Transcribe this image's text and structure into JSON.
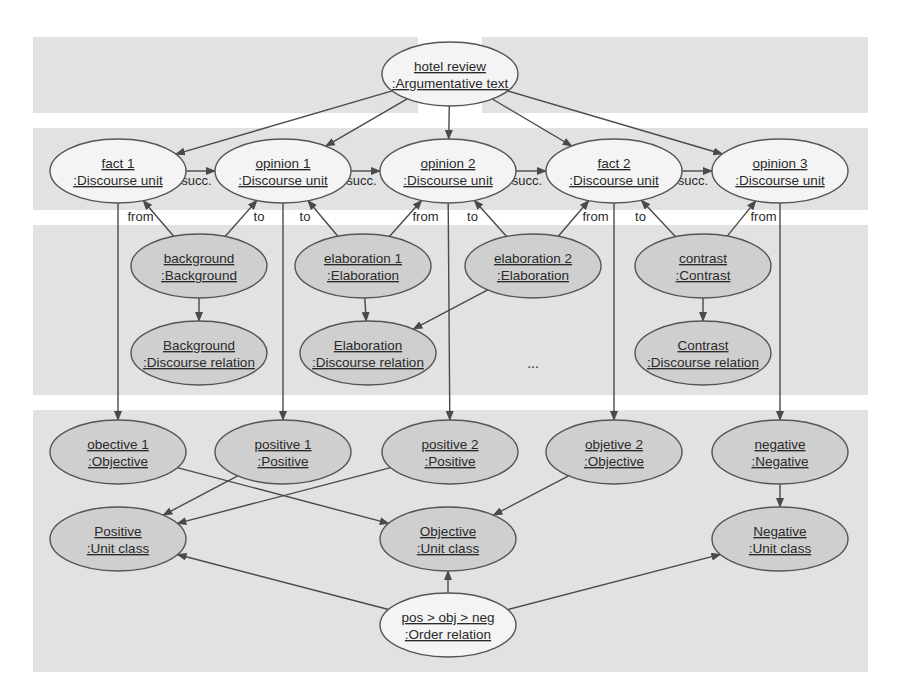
{
  "diagram": {
    "type": "uml-object-diagram",
    "colors": {
      "band": "#e2e2e2",
      "node_white": "#f4f4f4",
      "node_gray": "#cfcfcf",
      "stroke": "#555555",
      "text": "#2a2a2a"
    },
    "nodes": [
      {
        "id": "hotel_review",
        "name": "hotel review",
        "type": ":Argumentative text",
        "style": "white"
      },
      {
        "id": "fact1",
        "name": "fact 1",
        "type": ":Discourse unit",
        "style": "white"
      },
      {
        "id": "opinion1",
        "name": "opinion 1",
        "type": ":Discourse unit",
        "style": "white"
      },
      {
        "id": "opinion2",
        "name": "opinion 2",
        "type": ":Discourse unit",
        "style": "white"
      },
      {
        "id": "fact2",
        "name": "fact 2",
        "type": ":Discourse unit",
        "style": "white"
      },
      {
        "id": "opinion3",
        "name": "opinion 3",
        "type": ":Discourse unit",
        "style": "white"
      },
      {
        "id": "background",
        "name": "background",
        "type": ":Background",
        "style": "gray"
      },
      {
        "id": "elaboration1",
        "name": "elaboration 1",
        "type": ":Elaboration",
        "style": "gray"
      },
      {
        "id": "elaboration2",
        "name": "elaboration 2",
        "type": ":Elaboration",
        "style": "gray"
      },
      {
        "id": "contrast",
        "name": "contrast",
        "type": ":Contrast",
        "style": "gray"
      },
      {
        "id": "background_rel",
        "name": "Background",
        "type": ":Discourse relation",
        "style": "gray"
      },
      {
        "id": "elaboration_rel",
        "name": "Elaboration",
        "type": ":Discourse relation",
        "style": "gray"
      },
      {
        "id": "contrast_rel",
        "name": "Contrast",
        "type": ":Discourse relation",
        "style": "gray"
      },
      {
        "id": "objective1",
        "name": "obective 1",
        "type": ":Objective",
        "style": "gray"
      },
      {
        "id": "positive1",
        "name": "positive 1",
        "type": ":Positive",
        "style": "gray"
      },
      {
        "id": "positive2",
        "name": "positive 2",
        "type": ":Positive",
        "style": "gray"
      },
      {
        "id": "objective2",
        "name": "objetive 2",
        "type": ":Objective",
        "style": "gray"
      },
      {
        "id": "negative",
        "name": "negative",
        "type": ":Negative",
        "style": "gray"
      },
      {
        "id": "positive_class",
        "name": "Positive",
        "type": ":Unit class",
        "style": "gray"
      },
      {
        "id": "objective_class",
        "name": "Objective",
        "type": ":Unit class",
        "style": "gray"
      },
      {
        "id": "negative_class",
        "name": "Negative",
        "type": ":Unit class",
        "style": "gray"
      },
      {
        "id": "order",
        "name": "pos > obj > neg",
        "type": ":Order relation",
        "style": "white"
      }
    ],
    "ellipsis": "...",
    "edges": [
      {
        "from": "hotel_review",
        "to": "fact1",
        "label": ""
      },
      {
        "from": "hotel_review",
        "to": "opinion1",
        "label": ""
      },
      {
        "from": "hotel_review",
        "to": "opinion2",
        "label": ""
      },
      {
        "from": "hotel_review",
        "to": "fact2",
        "label": ""
      },
      {
        "from": "hotel_review",
        "to": "opinion3",
        "label": ""
      },
      {
        "from": "fact1",
        "to": "opinion1",
        "label": "succ."
      },
      {
        "from": "opinion1",
        "to": "opinion2",
        "label": "succ."
      },
      {
        "from": "opinion2",
        "to": "fact2",
        "label": "succ."
      },
      {
        "from": "fact2",
        "to": "opinion3",
        "label": "succ."
      },
      {
        "from": "background",
        "to": "fact1",
        "label": "from"
      },
      {
        "from": "background",
        "to": "opinion1",
        "label": "to"
      },
      {
        "from": "elaboration1",
        "to": "opinion1",
        "label": "to"
      },
      {
        "from": "elaboration1",
        "to": "opinion2",
        "label": "from"
      },
      {
        "from": "elaboration2",
        "to": "opinion2",
        "label": "to"
      },
      {
        "from": "elaboration2",
        "to": "fact2",
        "label": "from"
      },
      {
        "from": "contrast",
        "to": "fact2",
        "label": "to"
      },
      {
        "from": "contrast",
        "to": "opinion3",
        "label": "from"
      },
      {
        "from": "background",
        "to": "background_rel",
        "label": ""
      },
      {
        "from": "elaboration1",
        "to": "elaboration_rel",
        "label": ""
      },
      {
        "from": "elaboration2",
        "to": "elaboration_rel",
        "label": ""
      },
      {
        "from": "contrast",
        "to": "contrast_rel",
        "label": ""
      },
      {
        "from": "fact1",
        "to": "objective1",
        "label": ""
      },
      {
        "from": "opinion1",
        "to": "positive1",
        "label": ""
      },
      {
        "from": "opinion2",
        "to": "positive2",
        "label": ""
      },
      {
        "from": "fact2",
        "to": "objective2",
        "label": ""
      },
      {
        "from": "opinion3",
        "to": "negative",
        "label": ""
      },
      {
        "from": "objective1",
        "to": "objective_class",
        "label": ""
      },
      {
        "from": "positive1",
        "to": "positive_class",
        "label": ""
      },
      {
        "from": "positive2",
        "to": "positive_class",
        "label": ""
      },
      {
        "from": "objective2",
        "to": "objective_class",
        "label": ""
      },
      {
        "from": "negative",
        "to": "negative_class",
        "label": ""
      },
      {
        "from": "order",
        "to": "positive_class",
        "label": ""
      },
      {
        "from": "order",
        "to": "objective_class",
        "label": ""
      },
      {
        "from": "order",
        "to": "negative_class",
        "label": ""
      }
    ]
  }
}
